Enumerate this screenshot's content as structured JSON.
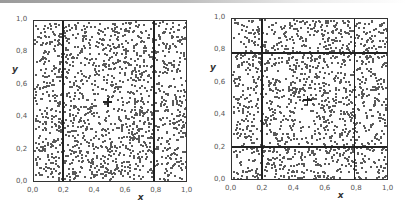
{
  "chart_data": [
    {
      "type": "scatter",
      "title": "",
      "xlabel": "x",
      "ylabel": "y",
      "xlim": [
        0.0,
        1.0
      ],
      "ylim": [
        0.0,
        1.0
      ],
      "x_ticks": [
        "0,0",
        "0,2",
        "0,4",
        "0,6",
        "0,8",
        "1,0"
      ],
      "y_ticks": [
        "0,0",
        "0,2",
        "0,4",
        "0,6",
        "0,8",
        "1,0"
      ],
      "grid": false,
      "legend": null,
      "points": "uniform random points covering the unit square (~1500 dots)",
      "vertical_lines_x": [
        0.19,
        0.78
      ],
      "horizontal_lines_y": [],
      "center_marker": {
        "x": 0.48,
        "y": 0.5,
        "shape": "+"
      },
      "layout": {
        "left": 33,
        "top": 20,
        "width": 154,
        "height": 162
      },
      "n_points": 1500,
      "seed": 17
    },
    {
      "type": "scatter",
      "title": "",
      "xlabel": "x",
      "ylabel": "y",
      "xlim": [
        0.0,
        1.0
      ],
      "ylim": [
        0.0,
        1.0
      ],
      "x_ticks": [
        "0,0",
        "0,2",
        "0,4",
        "0,6",
        "0,8",
        "1,0"
      ],
      "y_ticks": [
        "0,0",
        "0,2",
        "0,4",
        "0,6",
        "0,8",
        "1,0"
      ],
      "grid": false,
      "legend": null,
      "points": "uniform random points covering the unit square (~1500 dots)",
      "vertical_lines_x": [
        0.19,
        0.78
      ],
      "horizontal_lines_y": [
        0.21,
        0.79
      ],
      "center_marker": {
        "x": 0.48,
        "y": 0.5,
        "shape": "+"
      },
      "layout": {
        "left": 231,
        "top": 18,
        "width": 157,
        "height": 162
      },
      "n_points": 1500,
      "seed": 91
    }
  ],
  "colors": {
    "dot": "#5a5a5a",
    "line": "#222222",
    "tick_text": "#555555"
  }
}
